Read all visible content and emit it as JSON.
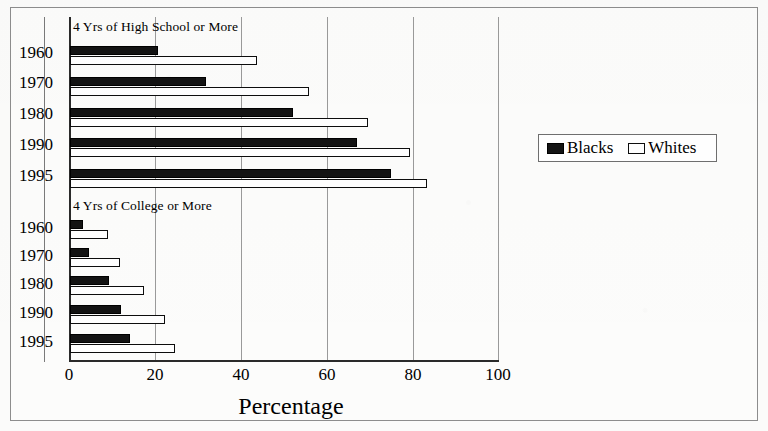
{
  "chart_data": {
    "type": "bar",
    "orientation": "horizontal",
    "title": "",
    "xlabel": "Percentage",
    "ylabel": "",
    "xlim": [
      0,
      100
    ],
    "xticks": [
      0,
      20,
      40,
      60,
      80,
      100
    ],
    "xtick_labels": [
      "0",
      "20",
      "40",
      "60",
      "80",
      "100"
    ],
    "grid": true,
    "grid_axis": "x",
    "legend_position": "right",
    "legend": [
      "Blacks",
      "Whites"
    ],
    "groups": [
      {
        "label": "4 Yrs of High School or More",
        "categories": [
          "1960",
          "1970",
          "1980",
          "1990",
          "1995"
        ],
        "series": [
          {
            "name": "Blacks",
            "values": [
              20.4,
              31.8,
              52.0,
              66.9,
              74.8
            ]
          },
          {
            "name": "Whites",
            "values": [
              43.6,
              55.6,
              69.5,
              79.3,
              83.2
            ]
          }
        ]
      },
      {
        "label": "4 Yrs of College or More",
        "categories": [
          "1960",
          "1970",
          "1980",
          "1990",
          "1995"
        ],
        "series": [
          {
            "name": "Blacks",
            "values": [
              3.0,
              4.4,
              9.0,
              12.0,
              13.9
            ]
          },
          {
            "name": "Whites",
            "values": [
              8.8,
              11.7,
              17.3,
              22.2,
              24.5
            ]
          }
        ]
      }
    ],
    "colors": {
      "blacks": "#131313",
      "whites": "#ffffff",
      "outline": "#0d0d0d",
      "gridline": "#9a9a9a",
      "axis": "#2a2a2a"
    }
  },
  "legend": {
    "entries": [
      {
        "label": "Blacks",
        "swatch": "filled-black-swatch"
      },
      {
        "label": "Whites",
        "swatch": "outlined-white-swatch"
      }
    ]
  },
  "captions": {
    "high_school": "4 Yrs of High School or More",
    "college": "4 Yrs of College or More"
  },
  "axis": {
    "title": "Percentage",
    "tick_labels": [
      "0",
      "20",
      "40",
      "60",
      "80",
      "100"
    ]
  },
  "years": [
    "1960",
    "1970",
    "1980",
    "1990",
    "1995"
  ]
}
